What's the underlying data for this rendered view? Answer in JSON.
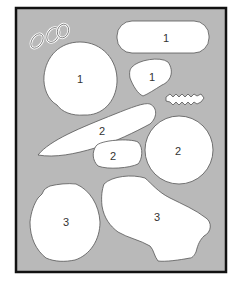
{
  "figure": {
    "colors": {
      "background": "#ffffff",
      "board_fill": "#b9b9b9",
      "frame": "#111111",
      "piece_fill": "#ffffff",
      "piece_outline": "#555555",
      "label_text": "#333333"
    },
    "pieces": [
      {
        "id": "piece-rounded-rectangle",
        "group": "1",
        "shape": "rounded rectangle"
      },
      {
        "id": "piece-large-circle",
        "group": "1",
        "shape": "large irregular circle"
      },
      {
        "id": "piece-small-polygon",
        "group": "1",
        "shape": "small rounded quadrilateral"
      },
      {
        "id": "piece-long-blade",
        "group": "2",
        "shape": "long tapered blade"
      },
      {
        "id": "piece-small-capsule",
        "group": "2",
        "shape": "small capsule"
      },
      {
        "id": "piece-medium-circle",
        "group": "2",
        "shape": "medium circle"
      },
      {
        "id": "piece-rough-circle",
        "group": "3",
        "shape": "rough-edged circle"
      },
      {
        "id": "piece-irregular-slab",
        "group": "3",
        "shape": "irregular slab"
      },
      {
        "id": "piece-chain-links",
        "group": "",
        "shape": "chain links (unlabeled)"
      },
      {
        "id": "piece-zigzag",
        "group": "",
        "shape": "zigzag strip (unlabeled)"
      }
    ]
  }
}
